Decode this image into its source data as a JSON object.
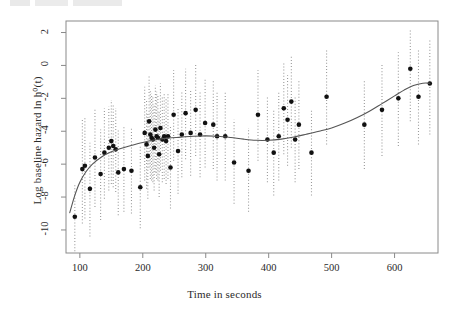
{
  "figure": {
    "header_artifact": "",
    "background_color": "#ffffff",
    "frame_color": "#8a8a8a",
    "point_color": "#111111",
    "curve_color": "#555555",
    "errorbar_color": "#9a9a9a"
  },
  "chart_data": {
    "type": "scatter",
    "title": "",
    "xlabel": "Time in seconds",
    "ylabel": "Log baseline hazard  ln h⁰(t)",
    "xlim": [
      78,
      669
    ],
    "ylim": [
      -11.4,
      2.7
    ],
    "xticks": [
      100,
      200,
      300,
      400,
      500,
      600
    ],
    "yticks": [
      2,
      0,
      -2,
      -4,
      -6,
      -8,
      -10
    ],
    "xtick_labels": [
      "100",
      "200",
      "300",
      "400",
      "500",
      "600"
    ],
    "ytick_labels": [
      "2",
      "0",
      "-2",
      "-4",
      "-6",
      "-8",
      "-10"
    ],
    "grid": false,
    "legend": null,
    "errorbar_style": "dotted-vertical",
    "points": [
      {
        "x": 92,
        "y": -9.2,
        "lo": -11.3,
        "hi": -7.2
      },
      {
        "x": 104,
        "y": -6.3,
        "lo": -9.6,
        "hi": -3.3
      },
      {
        "x": 108,
        "y": -6.1,
        "lo": -9.3,
        "hi": -3.2
      },
      {
        "x": 116,
        "y": -7.5,
        "lo": -10.4,
        "hi": -4.7
      },
      {
        "x": 124,
        "y": -5.6,
        "lo": -8.6,
        "hi": -2.7
      },
      {
        "x": 133,
        "y": -6.6,
        "lo": -9.4,
        "hi": -3.9
      },
      {
        "x": 139,
        "y": -5.3,
        "lo": -8.1,
        "hi": -2.6
      },
      {
        "x": 146,
        "y": -5.0,
        "lo": -7.6,
        "hi": -2.5
      },
      {
        "x": 150,
        "y": -4.6,
        "lo": -7.2,
        "hi": -2.1
      },
      {
        "x": 153,
        "y": -4.9,
        "lo": -7.4,
        "hi": -2.4
      },
      {
        "x": 157,
        "y": -5.1,
        "lo": -7.7,
        "hi": -2.6
      },
      {
        "x": 161,
        "y": -6.5,
        "lo": -9.1,
        "hi": -3.9
      },
      {
        "x": 170,
        "y": -6.3,
        "lo": -8.9,
        "hi": -3.7
      },
      {
        "x": 182,
        "y": -6.4,
        "lo": -9.0,
        "hi": -3.8
      },
      {
        "x": 196,
        "y": -7.4,
        "lo": -9.9,
        "hi": -4.9
      },
      {
        "x": 203,
        "y": -4.1,
        "lo": -7.0,
        "hi": -1.3
      },
      {
        "x": 206,
        "y": -4.8,
        "lo": -7.5,
        "hi": -2.1
      },
      {
        "x": 208,
        "y": -5.5,
        "lo": -8.1,
        "hi": -2.9
      },
      {
        "x": 210,
        "y": -3.4,
        "lo": -6.2,
        "hi": -0.6
      },
      {
        "x": 212,
        "y": -4.2,
        "lo": -6.9,
        "hi": -1.5
      },
      {
        "x": 214,
        "y": -4.4,
        "lo": -7.0,
        "hi": -1.7
      },
      {
        "x": 216,
        "y": -4.5,
        "lo": -7.1,
        "hi": -1.9
      },
      {
        "x": 218,
        "y": -5.0,
        "lo": -7.6,
        "hi": -2.4
      },
      {
        "x": 220,
        "y": -3.9,
        "lo": -6.5,
        "hi": -1.2
      },
      {
        "x": 222,
        "y": -4.3,
        "lo": -6.9,
        "hi": -1.6
      },
      {
        "x": 224,
        "y": -4.4,
        "lo": -7.0,
        "hi": -1.8
      },
      {
        "x": 226,
        "y": -5.4,
        "lo": -8.0,
        "hi": -2.8
      },
      {
        "x": 228,
        "y": -3.8,
        "lo": -6.4,
        "hi": -1.1
      },
      {
        "x": 231,
        "y": -4.5,
        "lo": -7.1,
        "hi": -1.9
      },
      {
        "x": 234,
        "y": -4.3,
        "lo": -6.9,
        "hi": -1.7
      },
      {
        "x": 237,
        "y": -4.6,
        "lo": -7.2,
        "hi": -2.0
      },
      {
        "x": 240,
        "y": -4.3,
        "lo": -6.9,
        "hi": -1.7
      },
      {
        "x": 244,
        "y": -6.2,
        "lo": -8.7,
        "hi": -3.7
      },
      {
        "x": 249,
        "y": -3.0,
        "lo": -5.8,
        "hi": -0.3
      },
      {
        "x": 256,
        "y": -5.2,
        "lo": -7.8,
        "hi": -2.6
      },
      {
        "x": 262,
        "y": -4.2,
        "lo": -6.8,
        "hi": -1.6
      },
      {
        "x": 268,
        "y": -2.9,
        "lo": -5.7,
        "hi": -0.2
      },
      {
        "x": 276,
        "y": -4.1,
        "lo": -6.7,
        "hi": -1.5
      },
      {
        "x": 284,
        "y": -2.7,
        "lo": -5.5,
        "hi": 0.1
      },
      {
        "x": 291,
        "y": -4.2,
        "lo": -6.8,
        "hi": -1.6
      },
      {
        "x": 299,
        "y": -3.5,
        "lo": -6.2,
        "hi": -0.8
      },
      {
        "x": 312,
        "y": -3.6,
        "lo": -6.3,
        "hi": -0.9
      },
      {
        "x": 318,
        "y": -4.3,
        "lo": -7.0,
        "hi": -1.6
      },
      {
        "x": 331,
        "y": -4.3,
        "lo": -7.0,
        "hi": -1.6
      },
      {
        "x": 345,
        "y": -5.9,
        "lo": -8.4,
        "hi": -3.3
      },
      {
        "x": 368,
        "y": -6.4,
        "lo": -8.9,
        "hi": -3.8
      },
      {
        "x": 383,
        "y": -3.0,
        "lo": -5.8,
        "hi": -0.3
      },
      {
        "x": 398,
        "y": -4.5,
        "lo": -7.1,
        "hi": -1.9
      },
      {
        "x": 408,
        "y": -5.3,
        "lo": -7.9,
        "hi": -2.7
      },
      {
        "x": 416,
        "y": -4.3,
        "lo": -7.0,
        "hi": -1.6
      },
      {
        "x": 424,
        "y": -2.6,
        "lo": -5.4,
        "hi": 0.2
      },
      {
        "x": 430,
        "y": -3.3,
        "lo": -6.1,
        "hi": -0.6
      },
      {
        "x": 436,
        "y": -2.2,
        "lo": -5.0,
        "hi": 0.6
      },
      {
        "x": 442,
        "y": -4.5,
        "lo": -7.1,
        "hi": -1.9
      },
      {
        "x": 448,
        "y": -3.6,
        "lo": -6.3,
        "hi": -0.9
      },
      {
        "x": 468,
        "y": -5.3,
        "lo": -7.9,
        "hi": -2.7
      },
      {
        "x": 492,
        "y": -1.9,
        "lo": -4.8,
        "hi": 0.9
      },
      {
        "x": 552,
        "y": -3.6,
        "lo": -6.3,
        "hi": -0.9
      },
      {
        "x": 580,
        "y": -2.7,
        "lo": -5.5,
        "hi": 0.1
      },
      {
        "x": 606,
        "y": -2.0,
        "lo": -4.9,
        "hi": 0.8
      },
      {
        "x": 625,
        "y": -0.2,
        "lo": -3.4,
        "hi": 2.2
      },
      {
        "x": 638,
        "y": -1.9,
        "lo": -4.8,
        "hi": 0.9
      },
      {
        "x": 656,
        "y": -1.1,
        "lo": -4.2,
        "hi": 1.6
      }
    ],
    "fitted_curve": [
      {
        "x": 84,
        "y": -8.95
      },
      {
        "x": 92,
        "y": -7.9
      },
      {
        "x": 100,
        "y": -7.1
      },
      {
        "x": 110,
        "y": -6.45
      },
      {
        "x": 120,
        "y": -6.0
      },
      {
        "x": 135,
        "y": -5.55
      },
      {
        "x": 150,
        "y": -5.25
      },
      {
        "x": 165,
        "y": -5.05
      },
      {
        "x": 180,
        "y": -4.88
      },
      {
        "x": 200,
        "y": -4.68
      },
      {
        "x": 220,
        "y": -4.52
      },
      {
        "x": 240,
        "y": -4.42
      },
      {
        "x": 260,
        "y": -4.36
      },
      {
        "x": 280,
        "y": -4.3
      },
      {
        "x": 300,
        "y": -4.28
      },
      {
        "x": 320,
        "y": -4.3
      },
      {
        "x": 340,
        "y": -4.38
      },
      {
        "x": 360,
        "y": -4.48
      },
      {
        "x": 380,
        "y": -4.55
      },
      {
        "x": 400,
        "y": -4.55
      },
      {
        "x": 420,
        "y": -4.48
      },
      {
        "x": 440,
        "y": -4.35
      },
      {
        "x": 460,
        "y": -4.18
      },
      {
        "x": 480,
        "y": -4.0
      },
      {
        "x": 500,
        "y": -3.8
      },
      {
        "x": 520,
        "y": -3.52
      },
      {
        "x": 540,
        "y": -3.18
      },
      {
        "x": 560,
        "y": -2.78
      },
      {
        "x": 580,
        "y": -2.32
      },
      {
        "x": 600,
        "y": -1.85
      },
      {
        "x": 615,
        "y": -1.5
      },
      {
        "x": 630,
        "y": -1.22
      },
      {
        "x": 645,
        "y": -1.08
      },
      {
        "x": 656,
        "y": -1.08
      }
    ]
  }
}
